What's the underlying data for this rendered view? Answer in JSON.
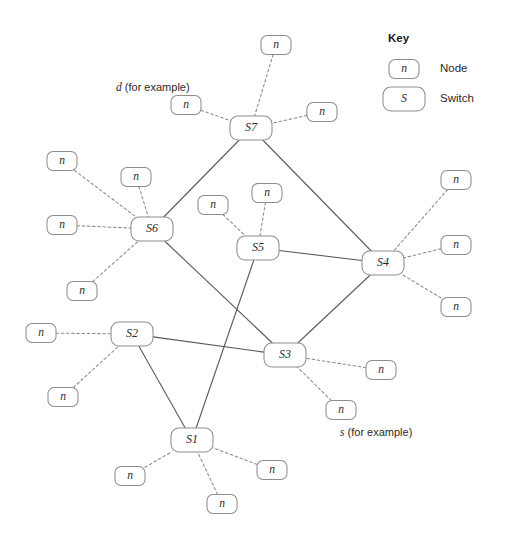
{
  "figure": {
    "kind": "network-topology-diagram",
    "width": 505,
    "height": 546,
    "background": "#ffffff",
    "edge_solid_color": "#5a5a5a",
    "edge_dashed_color": "#8a8a8a",
    "box_stroke_color": "#8e8e8e",
    "box_fill_color": "#ffffff",
    "text_color": "#2b2b2b"
  },
  "key": {
    "heading": "Key",
    "entries": [
      {
        "symbol": "n",
        "label": "Node",
        "shape": "small-rounded-rect"
      },
      {
        "symbol": "S",
        "label": "Switch",
        "shape": "large-rounded-rect"
      }
    ]
  },
  "annotations": [
    {
      "id": "annot-d",
      "variable": "d",
      "suffix": " (for example)",
      "x": 116,
      "y": 88
    },
    {
      "id": "annot-s",
      "variable": "s",
      "suffix": " (for example)",
      "x": 340,
      "y": 433
    }
  ],
  "switches": [
    {
      "id": "S1",
      "label": "S1",
      "x": 192,
      "y": 440,
      "w": 42,
      "h": 24
    },
    {
      "id": "S2",
      "label": "S2",
      "x": 132,
      "y": 334,
      "w": 42,
      "h": 24
    },
    {
      "id": "S3",
      "label": "S3",
      "x": 285,
      "y": 355,
      "w": 42,
      "h": 24
    },
    {
      "id": "S4",
      "label": "S4",
      "x": 383,
      "y": 263,
      "w": 42,
      "h": 24
    },
    {
      "id": "S5",
      "label": "S5",
      "x": 258,
      "y": 248,
      "w": 42,
      "h": 24
    },
    {
      "id": "S6",
      "label": "S6",
      "x": 152,
      "y": 229,
      "w": 42,
      "h": 24
    },
    {
      "id": "S7",
      "label": "S7",
      "x": 251,
      "y": 128,
      "w": 42,
      "h": 24
    }
  ],
  "nodes": [
    {
      "id": "n-s7-top",
      "label": "n",
      "x": 276,
      "y": 45,
      "w": 30,
      "h": 19,
      "switch": "S7"
    },
    {
      "id": "n-s7-left",
      "label": "n",
      "x": 186,
      "y": 105,
      "w": 30,
      "h": 19,
      "switch": "S7"
    },
    {
      "id": "n-s7-right",
      "label": "n",
      "x": 322,
      "y": 112,
      "w": 30,
      "h": 19,
      "switch": "S7"
    },
    {
      "id": "n-s6-upleft",
      "label": "n",
      "x": 62,
      "y": 161,
      "w": 30,
      "h": 19,
      "switch": "S6"
    },
    {
      "id": "n-s6-up",
      "label": "n",
      "x": 136,
      "y": 177,
      "w": 30,
      "h": 19,
      "switch": "S6"
    },
    {
      "id": "n-s6-left",
      "label": "n",
      "x": 62,
      "y": 225,
      "w": 30,
      "h": 19,
      "switch": "S6"
    },
    {
      "id": "n-s6-down",
      "label": "n",
      "x": 82,
      "y": 291,
      "w": 30,
      "h": 19,
      "switch": "S6"
    },
    {
      "id": "n-s5-left",
      "label": "n",
      "x": 213,
      "y": 205,
      "w": 30,
      "h": 19,
      "switch": "S5"
    },
    {
      "id": "n-s5-top",
      "label": "n",
      "x": 267,
      "y": 193,
      "w": 30,
      "h": 19,
      "switch": "S5"
    },
    {
      "id": "n-s4-top",
      "label": "n",
      "x": 456,
      "y": 180,
      "w": 30,
      "h": 19,
      "switch": "S4"
    },
    {
      "id": "n-s4-mid",
      "label": "n",
      "x": 456,
      "y": 245,
      "w": 30,
      "h": 19,
      "switch": "S4"
    },
    {
      "id": "n-s4-bot",
      "label": "n",
      "x": 456,
      "y": 307,
      "w": 30,
      "h": 19,
      "switch": "S4"
    },
    {
      "id": "n-s2-left",
      "label": "n",
      "x": 41,
      "y": 333,
      "w": 30,
      "h": 19,
      "switch": "S2"
    },
    {
      "id": "n-s2-down",
      "label": "n",
      "x": 63,
      "y": 397,
      "w": 30,
      "h": 19,
      "switch": "S2"
    },
    {
      "id": "n-s3-right",
      "label": "n",
      "x": 381,
      "y": 370,
      "w": 30,
      "h": 19,
      "switch": "S3"
    },
    {
      "id": "n-s3-down",
      "label": "n",
      "x": 341,
      "y": 410,
      "w": 30,
      "h": 19,
      "switch": "S3"
    },
    {
      "id": "n-s1-left",
      "label": "n",
      "x": 130,
      "y": 476,
      "w": 30,
      "h": 19,
      "switch": "S1"
    },
    {
      "id": "n-s1-bot",
      "label": "n",
      "x": 222,
      "y": 504,
      "w": 30,
      "h": 19,
      "switch": "S1"
    },
    {
      "id": "n-s1-right",
      "label": "n",
      "x": 272,
      "y": 470,
      "w": 30,
      "h": 19,
      "switch": "S1"
    }
  ],
  "switch_links": [
    {
      "id": "link-S7-S6",
      "from": "S7",
      "to": "S6"
    },
    {
      "id": "link-S7-S4",
      "from": "S7",
      "to": "S4"
    },
    {
      "id": "link-S5-S4",
      "from": "S5",
      "to": "S4"
    },
    {
      "id": "link-S4-S3",
      "from": "S4",
      "to": "S3"
    },
    {
      "id": "link-S6-S3",
      "from": "S6",
      "to": "S3"
    },
    {
      "id": "link-S5-S1",
      "from": "S5",
      "to": "S1"
    },
    {
      "id": "link-S2-S3",
      "from": "S2",
      "to": "S3"
    },
    {
      "id": "link-S2-S1",
      "from": "S2",
      "to": "S1"
    }
  ],
  "node_links": [
    {
      "id": "nlink-1",
      "node": "n-s7-top",
      "switch": "S7"
    },
    {
      "id": "nlink-2",
      "node": "n-s7-left",
      "switch": "S7"
    },
    {
      "id": "nlink-3",
      "node": "n-s7-right",
      "switch": "S7"
    },
    {
      "id": "nlink-4",
      "node": "n-s6-upleft",
      "switch": "S6"
    },
    {
      "id": "nlink-5",
      "node": "n-s6-up",
      "switch": "S6"
    },
    {
      "id": "nlink-6",
      "node": "n-s6-left",
      "switch": "S6"
    },
    {
      "id": "nlink-7",
      "node": "n-s6-down",
      "switch": "S6"
    },
    {
      "id": "nlink-8",
      "node": "n-s5-left",
      "switch": "S5"
    },
    {
      "id": "nlink-9",
      "node": "n-s5-top",
      "switch": "S5"
    },
    {
      "id": "nlink-10",
      "node": "n-s4-top",
      "switch": "S4"
    },
    {
      "id": "nlink-11",
      "node": "n-s4-mid",
      "switch": "S4"
    },
    {
      "id": "nlink-12",
      "node": "n-s4-bot",
      "switch": "S4"
    },
    {
      "id": "nlink-13",
      "node": "n-s2-left",
      "switch": "S2"
    },
    {
      "id": "nlink-14",
      "node": "n-s2-down",
      "switch": "S2"
    },
    {
      "id": "nlink-15",
      "node": "n-s3-right",
      "switch": "S3"
    },
    {
      "id": "nlink-16",
      "node": "n-s3-down",
      "switch": "S3"
    },
    {
      "id": "nlink-17",
      "node": "n-s1-left",
      "switch": "S1"
    },
    {
      "id": "nlink-18",
      "node": "n-s1-bot",
      "switch": "S1"
    },
    {
      "id": "nlink-19",
      "node": "n-s1-right",
      "switch": "S1"
    }
  ],
  "key_layout": {
    "heading_x": 388,
    "heading_y": 39,
    "node_box": {
      "x": 404,
      "y": 69,
      "w": 30,
      "h": 19
    },
    "switch_box": {
      "x": 404,
      "y": 99,
      "w": 42,
      "h": 24
    },
    "node_label_x": 440,
    "node_label_y": 69,
    "switch_label_x": 440,
    "switch_label_y": 99
  }
}
